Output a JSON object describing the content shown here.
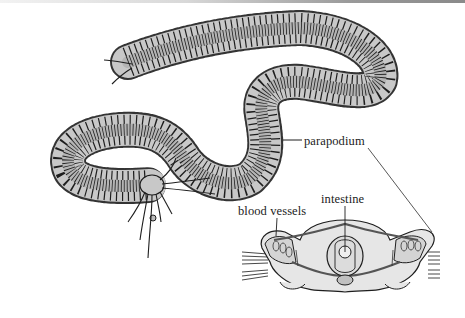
{
  "figure": {
    "labels": {
      "parapodium": "parapodium",
      "intestine": "intestine",
      "blood_vessels": "blood vessels"
    },
    "colors": {
      "body_fill": "#c8c8c8",
      "outline": "#1e1e1e",
      "section_fill": "#e6e6e6",
      "background": "#ffffff"
    }
  }
}
